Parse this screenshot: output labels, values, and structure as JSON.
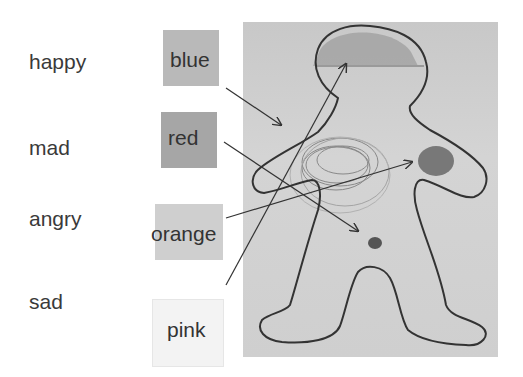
{
  "emotions": [
    {
      "label": "happy"
    },
    {
      "label": "mad"
    },
    {
      "label": "angry"
    },
    {
      "label": "sad"
    }
  ],
  "colors": [
    {
      "label": "blue",
      "swatch": "#b8b8b8"
    },
    {
      "label": "red",
      "swatch": "#a4a4a4"
    },
    {
      "label": "orange",
      "swatch": "#cdcdcd"
    },
    {
      "label": "pink",
      "swatch": "#f2f2f2"
    }
  ],
  "figure": {
    "marks": [
      {
        "color": "blue",
        "location": "head"
      },
      {
        "color": "red",
        "location": "lower-abdomen"
      },
      {
        "color": "orange",
        "location": "right-chest"
      },
      {
        "color": "pink",
        "location": "left-chest scribble"
      }
    ]
  }
}
